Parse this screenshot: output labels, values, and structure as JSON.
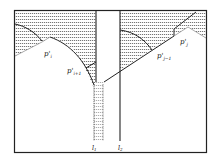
{
  "figure": {
    "labels": {
      "p_i": "p'",
      "p_i_sub": "i",
      "p_i1": "p'",
      "p_i1_sub": "i+1",
      "p_j1": "p'",
      "p_j1_sub": "j−1",
      "p_j": "p'",
      "p_j_sub": "j",
      "l1": "l",
      "l1_sub": "1",
      "l2": "l",
      "l2_sub": "2"
    },
    "colors": {
      "stroke": "#222222",
      "hatch": "#555555",
      "background": "#ffffff"
    }
  }
}
